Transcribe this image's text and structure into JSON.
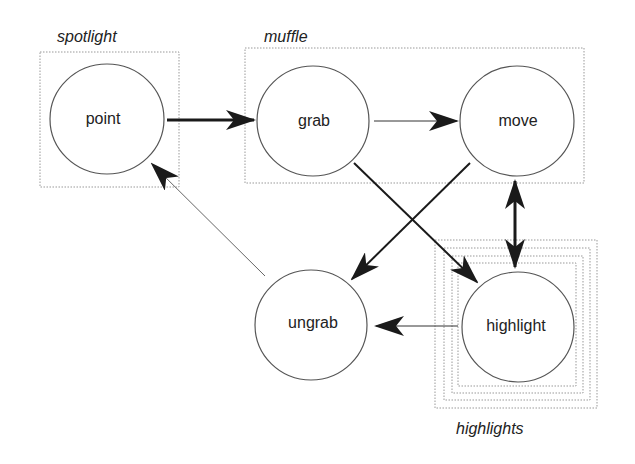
{
  "diagram": {
    "type": "state-diagram",
    "groups": [
      {
        "id": "spotlight",
        "label": "spotlight"
      },
      {
        "id": "muffle",
        "label": "muffle"
      },
      {
        "id": "highlights",
        "label": "highlights"
      }
    ],
    "nodes": [
      {
        "id": "point",
        "label": "point"
      },
      {
        "id": "grab",
        "label": "grab"
      },
      {
        "id": "move",
        "label": "move"
      },
      {
        "id": "ungrab",
        "label": "ungrab"
      },
      {
        "id": "highlight",
        "label": "highlight"
      }
    ],
    "edges": [
      {
        "from": "point",
        "to": "grab",
        "weight": "thick"
      },
      {
        "from": "grab",
        "to": "move",
        "weight": "thin"
      },
      {
        "from": "grab",
        "to": "highlight",
        "weight": "medium"
      },
      {
        "from": "move",
        "to": "ungrab",
        "weight": "medium"
      },
      {
        "from": "move",
        "to": "highlight",
        "weight": "thick",
        "bidirectional": true
      },
      {
        "from": "highlight",
        "to": "ungrab",
        "weight": "thin"
      },
      {
        "from": "ungrab",
        "to": "point",
        "weight": "thin"
      }
    ]
  }
}
